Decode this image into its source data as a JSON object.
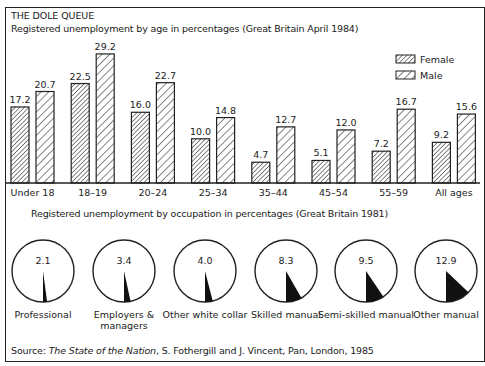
{
  "header": {
    "title": "THE DOLE QUEUE",
    "subtitle": "Registered unemployment by age in percentages (Great Britain April 1984)"
  },
  "occupation_section": {
    "subtitle": "Registered unemployment by occupation in percentages (Great Britain 1981)"
  },
  "source": {
    "prefix": "Source: ",
    "title": "The State of the Nation",
    "rest": ", S. Fothergill and J. Vincent, Pan, London, 1985"
  },
  "chart_data": [
    {
      "type": "bar",
      "title": "Registered unemployment by age in percentages (Great Britain April 1984)",
      "xlabel": "",
      "ylabel": "",
      "categories": [
        "Under 18",
        "18–19",
        "20–24",
        "25–34",
        "35–44",
        "45–54",
        "55–59",
        "All ages"
      ],
      "series": [
        {
          "name": "Female",
          "values": [
            17.2,
            22.5,
            16.0,
            10.0,
            4.7,
            5.1,
            7.2,
            9.2
          ]
        },
        {
          "name": "Male",
          "values": [
            20.7,
            29.2,
            22.7,
            14.8,
            12.7,
            12.0,
            16.7,
            15.6
          ]
        }
      ],
      "value_labels": {
        "Female": [
          "17.2",
          "22.5",
          "16.0",
          "10.0",
          "4.7",
          "5.1",
          "7.2",
          "9.2"
        ],
        "Male": [
          "20.7",
          "29.2",
          "22.7",
          "14.8",
          "12.7",
          "12.0",
          "16.7",
          "15.6"
        ]
      },
      "legend": [
        "Female",
        "Male"
      ],
      "legend_position": "top-right",
      "grid": false,
      "ylim": [
        0,
        30
      ]
    },
    {
      "type": "pie",
      "title": "Registered unemployment by occupation in percentages (Great Britain 1981)",
      "categories": [
        "Professional",
        "Employers & managers",
        "Other white collar",
        "Skilled manual",
        "Semi-skilled manual",
        "Other manual"
      ],
      "values": [
        2.1,
        3.4,
        4.0,
        8.3,
        9.5,
        12.9
      ],
      "value_labels": [
        "2.1",
        "3.4",
        "4.0",
        "8.3",
        "9.5",
        "12.9"
      ],
      "label_lines": [
        [
          "Professional"
        ],
        [
          "Employers &",
          "managers"
        ],
        [
          "Other white collar"
        ],
        [
          "Skilled manual"
        ],
        [
          "Semi-skilled manual"
        ],
        [
          "Other manual"
        ]
      ]
    }
  ]
}
